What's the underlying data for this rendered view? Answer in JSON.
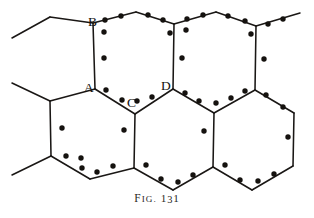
{
  "figure": {
    "caption_prefix": "F",
    "caption_prefix_rest": "IG.",
    "caption_number_head": "1",
    "caption_number_mid": "3",
    "caption_number_tail": "1",
    "caption_full": "FIG. 131",
    "line_color": "#1a1715",
    "dot_color": "#15120f",
    "background_color": "#ffffff"
  },
  "labels": [
    {
      "id": "A",
      "text": "A",
      "x": 84,
      "y": 92
    },
    {
      "id": "B",
      "text": "B",
      "x": 88,
      "y": 26
    },
    {
      "id": "C",
      "text": "C",
      "x": 127,
      "y": 107
    },
    {
      "id": "D",
      "text": "D",
      "x": 161,
      "y": 90
    }
  ],
  "bonds": [
    {
      "name": "stub-top-left",
      "x1": 12,
      "y1": 38,
      "x2": 50,
      "y2": 17
    },
    {
      "name": "upper-left-top-edge",
      "x1": 50,
      "y1": 17,
      "x2": 93,
      "y2": 23
    },
    {
      "name": "hex1-top-left-edge",
      "x1": 93,
      "y1": 23,
      "x2": 136,
      "y2": 12
    },
    {
      "name": "hex1-top-right-edge",
      "x1": 136,
      "y1": 12,
      "x2": 174,
      "y2": 24
    },
    {
      "name": "hex2-top-left-edge",
      "x1": 174,
      "y1": 24,
      "x2": 216,
      "y2": 12
    },
    {
      "name": "hex2-top-right-edge",
      "x1": 216,
      "y1": 12,
      "x2": 256,
      "y2": 26
    },
    {
      "name": "stub-top-right",
      "x1": 256,
      "y1": 26,
      "x2": 300,
      "y2": 13
    },
    {
      "name": "bond-A-B",
      "x1": 93,
      "y1": 23,
      "x2": 95,
      "y2": 89
    },
    {
      "name": "bond-D-vertical",
      "x1": 174,
      "y1": 24,
      "x2": 173,
      "y2": 89
    },
    {
      "name": "bond-right-vertical",
      "x1": 256,
      "y1": 26,
      "x2": 255,
      "y2": 90
    },
    {
      "name": "stub-left-upper",
      "x1": 12,
      "y1": 83,
      "x2": 50,
      "y2": 101
    },
    {
      "name": "row2-left-edge",
      "x1": 50,
      "y1": 101,
      "x2": 95,
      "y2": 89
    },
    {
      "name": "bond-A-C",
      "x1": 95,
      "y1": 89,
      "x2": 135,
      "y2": 114
    },
    {
      "name": "bond-C-D",
      "x1": 135,
      "y1": 114,
      "x2": 173,
      "y2": 89
    },
    {
      "name": "hex-mid-right-up",
      "x1": 173,
      "y1": 89,
      "x2": 214,
      "y2": 113
    },
    {
      "name": "hex-mid-right-down",
      "x1": 214,
      "y1": 113,
      "x2": 255,
      "y2": 90
    },
    {
      "name": "far-right-upper-edge",
      "x1": 255,
      "y1": 90,
      "x2": 294,
      "y2": 113
    },
    {
      "name": "hexA-left-vertical",
      "x1": 50,
      "y1": 101,
      "x2": 51,
      "y2": 156
    },
    {
      "name": "hexB-left-vertical",
      "x1": 135,
      "y1": 114,
      "x2": 134,
      "y2": 168
    },
    {
      "name": "hexC-left-vertical",
      "x1": 214,
      "y1": 113,
      "x2": 213,
      "y2": 167
    },
    {
      "name": "far-right-vertical",
      "x1": 294,
      "y1": 113,
      "x2": 293,
      "y2": 166
    },
    {
      "name": "stub-left-lower",
      "x1": 12,
      "y1": 175,
      "x2": 51,
      "y2": 156
    },
    {
      "name": "bottom-edge-1",
      "x1": 51,
      "y1": 156,
      "x2": 90,
      "y2": 179
    },
    {
      "name": "bottom-edge-2",
      "x1": 90,
      "y1": 179,
      "x2": 134,
      "y2": 168
    },
    {
      "name": "bottom-edge-3",
      "x1": 134,
      "y1": 168,
      "x2": 173,
      "y2": 190
    },
    {
      "name": "bottom-edge-4",
      "x1": 173,
      "y1": 190,
      "x2": 213,
      "y2": 167
    },
    {
      "name": "bottom-edge-5",
      "x1": 213,
      "y1": 167,
      "x2": 252,
      "y2": 190
    },
    {
      "name": "bottom-edge-6",
      "x1": 252,
      "y1": 190,
      "x2": 293,
      "y2": 166
    }
  ],
  "electron_dots": [
    {
      "x": 105,
      "y": 20
    },
    {
      "x": 121,
      "y": 16
    },
    {
      "x": 148,
      "y": 15
    },
    {
      "x": 163,
      "y": 20
    },
    {
      "x": 187,
      "y": 19
    },
    {
      "x": 203,
      "y": 15
    },
    {
      "x": 228,
      "y": 16
    },
    {
      "x": 245,
      "y": 21
    },
    {
      "x": 268,
      "y": 24
    },
    {
      "x": 283,
      "y": 19
    },
    {
      "x": 104,
      "y": 32
    },
    {
      "x": 170,
      "y": 33
    },
    {
      "x": 186,
      "y": 30
    },
    {
      "x": 251,
      "y": 34
    },
    {
      "x": 104,
      "y": 58
    },
    {
      "x": 182,
      "y": 58
    },
    {
      "x": 264,
      "y": 59
    },
    {
      "x": 106,
      "y": 90
    },
    {
      "x": 122,
      "y": 100
    },
    {
      "x": 137,
      "y": 101
    },
    {
      "x": 152,
      "y": 97
    },
    {
      "x": 185,
      "y": 93
    },
    {
      "x": 199,
      "y": 101
    },
    {
      "x": 216,
      "y": 103
    },
    {
      "x": 231,
      "y": 98
    },
    {
      "x": 245,
      "y": 91
    },
    {
      "x": 266,
      "y": 95
    },
    {
      "x": 283,
      "y": 107
    },
    {
      "x": 62,
      "y": 128
    },
    {
      "x": 124,
      "y": 130
    },
    {
      "x": 204,
      "y": 131
    },
    {
      "x": 288,
      "y": 137
    },
    {
      "x": 66,
      "y": 156
    },
    {
      "x": 82,
      "y": 168
    },
    {
      "x": 97,
      "y": 172
    },
    {
      "x": 113,
      "y": 166
    },
    {
      "x": 146,
      "y": 165
    },
    {
      "x": 161,
      "y": 179
    },
    {
      "x": 178,
      "y": 182
    },
    {
      "x": 193,
      "y": 175
    },
    {
      "x": 225,
      "y": 165
    },
    {
      "x": 240,
      "y": 180
    },
    {
      "x": 258,
      "y": 181
    },
    {
      "x": 274,
      "y": 174
    },
    {
      "x": 81,
      "y": 158
    }
  ]
}
